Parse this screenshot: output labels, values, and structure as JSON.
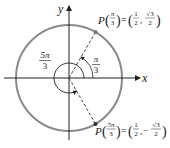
{
  "diagram": {
    "type": "unit-circle",
    "axes": {
      "x_label": "x",
      "y_label": "y"
    },
    "colors": {
      "circle": "#888888",
      "axis": "#222222",
      "dash": "#444444",
      "point": "#555555"
    },
    "angles": [
      {
        "label_num": "π",
        "label_den": "3",
        "value": "π/3"
      },
      {
        "label_num": "5π",
        "label_den": "3",
        "value": "5π/3"
      }
    ],
    "points": [
      {
        "name": "P",
        "arg_num": "π",
        "arg_den": "3",
        "x_num": "1",
        "x_den": "2",
        "y_sign": "",
        "y_num": "√3",
        "y_den": "2",
        "text": "P(π/3) = (1/2, √3/2)"
      },
      {
        "name": "P",
        "arg_num": "5π",
        "arg_den": "3",
        "x_num": "1",
        "x_den": "2",
        "y_sign": "−",
        "y_num": "√3",
        "y_den": "2",
        "text": "P(5π/3) = (1/2, −√3/2)"
      }
    ],
    "symbols": {
      "equals": "=",
      "comma": ",",
      "lparen": "(",
      "rparen": ")"
    }
  }
}
